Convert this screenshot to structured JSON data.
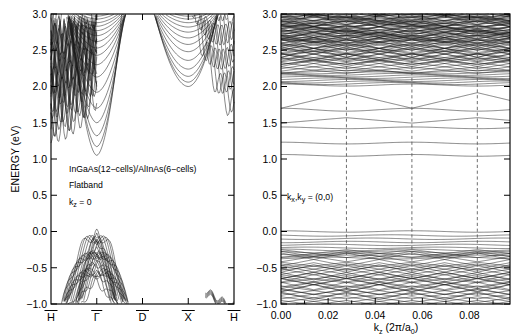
{
  "figure": {
    "title_hidden": "",
    "background": "#ffffff",
    "line_color": "#1a1a1a",
    "dash_color": "#555555"
  },
  "chart_data": [
    {
      "type": "line",
      "panel": "left",
      "title": "",
      "xlabel": "",
      "ylabel": "ENERGY (eV)",
      "ylim": [
        -1.0,
        3.0
      ],
      "yticks": [
        -1.0,
        -0.5,
        0.0,
        0.5,
        1.0,
        1.5,
        2.0,
        2.5,
        3.0
      ],
      "ytick_labels": [
        "-1.0",
        "-0.5",
        "0.0",
        "0.5",
        "1.0",
        "1.5",
        "2.0",
        "2.5",
        "3.0"
      ],
      "xlim": [
        0,
        4
      ],
      "xticks": [
        0,
        1,
        2,
        3,
        4
      ],
      "xtick_labels": [
        "H",
        "Γ",
        "D",
        "X",
        "H"
      ],
      "xtick_overbar": true,
      "grid": false,
      "legend": "none",
      "annotations": [
        {
          "text": "InGaAs(12−cells)/AlInAs(6−cells)",
          "x": 0.18,
          "y": 0.82
        },
        {
          "text": "Flatband",
          "x": 0.18,
          "y": 0.62
        },
        {
          "text": "k_z = 0",
          "x": 0.18,
          "y": 0.4
        }
      ],
      "description": "Superlattice band structure along H-Gamma-D-X-H; dense conduction manifold above 1.0 eV, valence dome peaking at 0.0 eV at Gamma.",
      "conduction_min_gamma": 1.05,
      "conduction_min_x": 2.0,
      "valence_max_gamma": 0.0,
      "band_count_conduction": 34,
      "band_count_valence": 30
    },
    {
      "type": "line",
      "panel": "right",
      "title": "",
      "xlabel": "k_z (2π/a_0)",
      "ylabel": "",
      "ylim": [
        -1.0,
        3.0
      ],
      "yticks": [
        -1.0,
        -0.5,
        0.0,
        0.5,
        1.0,
        1.5,
        2.0,
        2.5,
        3.0
      ],
      "ytick_labels": [
        "-1.0",
        "-0.5",
        "0.0",
        "0.5",
        "1.0",
        "1.5",
        "2.0",
        "2.5",
        "3.0"
      ],
      "xlim": [
        0.0,
        0.0972
      ],
      "xticks": [
        0.0,
        0.02,
        0.04,
        0.06,
        0.08
      ],
      "xtick_labels": [
        "0.00",
        "0.02",
        "0.04",
        "0.06",
        "0.08"
      ],
      "grid": false,
      "legend": "none",
      "vlines": [
        0.02778,
        0.05556,
        0.08333
      ],
      "annotations": [
        {
          "text": "(k_x,k_y) = (0,0)",
          "x": 0.004,
          "y": 0.5
        }
      ],
      "description": "Minizone dispersion vs kz showing flat and weakly dispersive minibands; dashed lines mark minizone boundaries.",
      "flat_bands": [
        1.05,
        1.22,
        1.43,
        1.5,
        1.7,
        2.02,
        2.09,
        2.14,
        2.2,
        0.0,
        -0.06,
        -0.11,
        -0.17
      ],
      "band_count": 58
    }
  ],
  "left_panel": {
    "ylabel": "ENERGY (eV)",
    "ytick_labels": [
      "3.0",
      "2.5",
      "2.0",
      "1.5",
      "1.0",
      "0.5",
      "0.0",
      "-0.5",
      "-1.0"
    ],
    "xtick_labels": [
      "H",
      "Γ",
      "D",
      "X",
      "H"
    ],
    "annotation_line1": "InGaAs(12−cells)/AlInAs(6−cells)",
    "annotation_line2": "Flatband",
    "annotation_line3_main": "k",
    "annotation_line3_sub": "z",
    "annotation_line3_rest": " = 0"
  },
  "right_panel": {
    "ytick_labels": [
      "3.0",
      "2.5",
      "2.0",
      "1.5",
      "1.0",
      "0.5",
      "0.0",
      "-0.5",
      "-1.0"
    ],
    "xtick_labels": [
      "0.00",
      "0.02",
      "0.04",
      "0.06",
      "0.08"
    ],
    "xlabel_main": "k",
    "xlabel_sub": "z",
    "xlabel_paren_open": " (2π/a",
    "xlabel_paren_sub": "0",
    "xlabel_paren_close": ")",
    "annotation": "(k  ,k  ) = (0,0)",
    "annotation_k": "k",
    "annotation_sub_x": "x",
    "annotation_sub_y": "y"
  }
}
